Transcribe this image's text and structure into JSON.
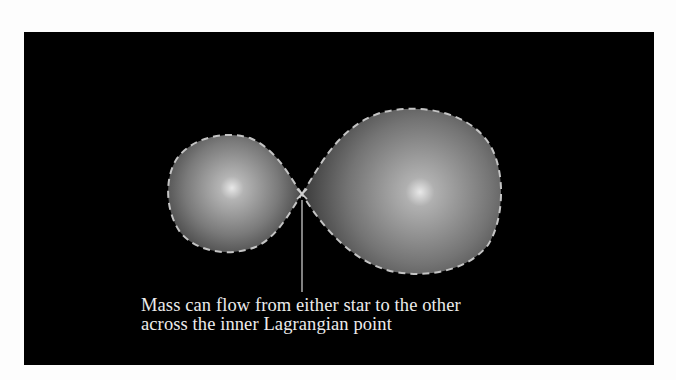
{
  "figure": {
    "background_color": "#000000",
    "caption": {
      "line1": "Mass can flow from either star to the other",
      "line2": "across the inner Lagrangian point"
    },
    "elements": {
      "star_small": {
        "label": "smaller star filling Roche lobe",
        "highlight": [
          232,
          188
        ]
      },
      "star_large": {
        "label": "larger star filling Roche lobe",
        "highlight": [
          420,
          192
        ]
      },
      "lagrangian_point": {
        "label": "inner Lagrangian point",
        "position": [
          302,
          194
        ]
      },
      "roche_lobe_outline": {
        "style": "dashed",
        "color": "#bdbdbd"
      }
    }
  }
}
